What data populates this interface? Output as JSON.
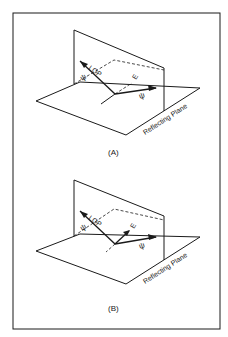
{
  "figure": {
    "panels": [
      {
        "id": "A",
        "caption": "(A)",
        "plane_label": "Reflecting Plane",
        "vector_labels": {
          "lop": "LOP",
          "psi_left": "ψ",
          "psi_right": "ψ",
          "e": "E"
        }
      },
      {
        "id": "B",
        "caption": "(B)",
        "plane_label": "Reflecting Plane",
        "vector_labels": {
          "lop": "LOP",
          "psi_left": "ψ",
          "psi_right": "ψ",
          "e": "E"
        }
      }
    ]
  }
}
